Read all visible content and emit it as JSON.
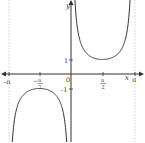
{
  "chart_data": {
    "type": "line",
    "title": "",
    "function": "y = csc(x)",
    "xlabel": "x",
    "ylabel": "y",
    "xlim": [
      -3.1416,
      3.1416
    ],
    "ylim": [
      -4.6,
      5.1
    ],
    "grid": false,
    "asymptotes": [
      "-π",
      "0",
      "π"
    ],
    "x_ticks": [
      {
        "value": -3.1416,
        "label": "-π"
      },
      {
        "value": -1.5708,
        "label": "-π/2"
      },
      {
        "value": 1.5708,
        "label": "π/2"
      },
      {
        "value": 3.1416,
        "label": "π"
      }
    ],
    "y_ticks": [
      {
        "value": 1,
        "label": "1"
      },
      {
        "value": -1,
        "label": "-1"
      }
    ],
    "origin_label": "0",
    "series": [
      {
        "name": "csc(x), -π<x<0",
        "x": [
          -3.0,
          -2.5,
          -2.0,
          -1.5708,
          -1.0,
          -0.5,
          -0.2
        ],
        "y": [
          -7.09,
          -1.67,
          -1.1,
          -1.0,
          -1.19,
          -2.09,
          -5.03
        ]
      },
      {
        "name": "csc(x), 0<x<π",
        "x": [
          0.2,
          0.5,
          1.0,
          1.5708,
          2.0,
          2.5,
          3.0
        ],
        "y": [
          5.03,
          2.09,
          1.19,
          1.0,
          1.1,
          1.67,
          7.09
        ]
      }
    ],
    "colors": {
      "curve": "#333333",
      "axis": "#333333",
      "asymptote": "#bbbbbb"
    }
  },
  "labels": {
    "x_axis": "x",
    "y_axis": "y",
    "origin": "0",
    "x_neg_pi": "-π",
    "x_neg_half_pi_num": "π",
    "x_neg_half_pi_den": "2",
    "x_half_pi_num": "π",
    "x_half_pi_den": "2",
    "x_pi": "π",
    "y_one": "1",
    "y_neg_one": "-1"
  }
}
